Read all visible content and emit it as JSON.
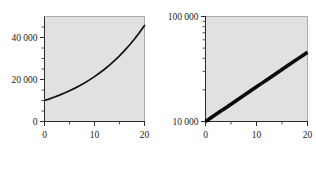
{
  "figure": {
    "background_color": "#ffffff",
    "plot_background_color": "#e1e1e1",
    "axis_color": "#2a2a2a",
    "data_color": "#111111"
  },
  "chart_data": [
    {
      "type": "line",
      "title": "",
      "subtitle": "",
      "xlabel": "",
      "ylabel": "",
      "panel": "left",
      "yscale": "linear",
      "xscale": "linear",
      "xlim": [
        0,
        20
      ],
      "ylim": [
        0,
        50000
      ],
      "grid": false,
      "legend": null,
      "xticks": [
        0,
        10,
        20
      ],
      "xticklabels": [
        "0",
        "10",
        "20"
      ],
      "xticks_minor": [
        5,
        15
      ],
      "yticks": [
        0,
        20000,
        40000
      ],
      "yticklabels": [
        "0",
        "20 000",
        "40 000"
      ],
      "yticks_minor": [
        5000,
        10000,
        15000,
        25000,
        30000,
        35000,
        45000
      ],
      "annotations": [],
      "series": [
        {
          "name": "compound growth",
          "x": [
            0,
            1,
            2,
            3,
            4,
            5,
            6,
            7,
            8,
            9,
            10,
            11,
            12,
            13,
            14,
            15,
            16,
            17,
            18,
            19,
            20
          ],
          "values": [
            10000,
            10790,
            11642,
            12561,
            13553,
            14623,
            15777,
            17023,
            18367,
            19817,
            21382,
            23070,
            24892,
            26858,
            28978,
            31266,
            33735,
            36399,
            39273,
            42375,
            45723
          ]
        }
      ]
    },
    {
      "type": "scatter",
      "title": "",
      "subtitle": "",
      "xlabel": "",
      "ylabel": "",
      "panel": "right",
      "yscale": "log",
      "xscale": "linear",
      "xlim": [
        0,
        20
      ],
      "ylim": [
        10000,
        100000
      ],
      "grid": false,
      "legend": null,
      "xticks": [
        0,
        10,
        20
      ],
      "xticklabels": [
        "0",
        "10",
        "20"
      ],
      "xticks_minor": [
        5,
        15
      ],
      "yticks": [
        10000,
        100000
      ],
      "yticklabels": [
        "10 000",
        "100 000"
      ],
      "yticks_minor": [
        20000,
        30000,
        40000,
        50000,
        60000,
        70000,
        80000,
        90000
      ],
      "annotations": [],
      "series": [
        {
          "name": "compound growth (log)",
          "x": [
            0,
            1,
            2,
            3,
            4,
            5,
            6,
            7,
            8,
            9,
            10,
            11,
            12,
            13,
            14,
            15,
            16,
            17,
            18,
            19,
            20
          ],
          "values": [
            10000,
            10790,
            11642,
            12561,
            13553,
            14623,
            15777,
            17023,
            18367,
            19817,
            21382,
            23070,
            24892,
            26858,
            28978,
            31266,
            33735,
            36399,
            39273,
            42375,
            45723
          ]
        }
      ]
    }
  ]
}
